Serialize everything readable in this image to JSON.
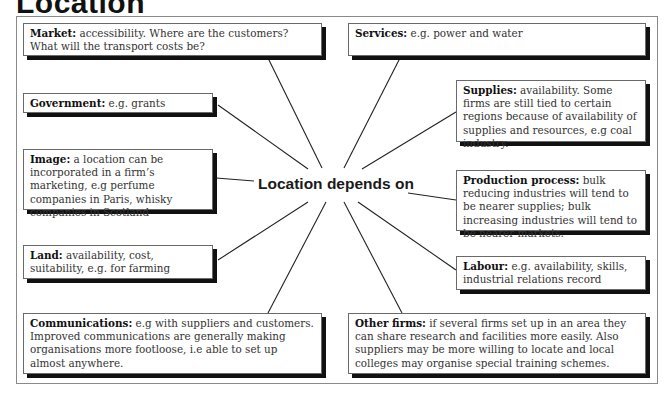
{
  "title": "Location",
  "center_label": "Location depends on",
  "colors": {
    "line": "#222222",
    "box_border": "#6a6a6a",
    "shadow": "#111111",
    "frame": "#8a8a8a"
  },
  "factors": {
    "market": {
      "label": "Market:",
      "text": " accessibility. Where are the customers? What will the transport costs be?"
    },
    "government": {
      "label": "Government:",
      "text": " e.g. grants"
    },
    "image": {
      "label": "Image:",
      "text": " a location can be incorporated in a firm’s marketing, e.g perfume companies in Paris, whisky companies in Scotland"
    },
    "land": {
      "label": "Land:",
      "text": " availability, cost, suitability, e.g. for farming"
    },
    "communications": {
      "label": "Communications:",
      "text": " e.g with suppliers and customers. Improved communications are generally making organisations more footloose, i.e able to set up almost anywhere."
    },
    "services": {
      "label": "Services:",
      "text": " e.g. power and water"
    },
    "supplies": {
      "label": "Supplies:",
      "text": " availability. Some firms are still tied to certain regions because of availability of supplies and resources, e.g coal industry."
    },
    "production": {
      "label": "Production process:",
      "text": " bulk reducing industries will tend to be nearer supplies; bulk increasing industries will tend to be nearer markets."
    },
    "labour": {
      "label": "Labour:",
      "text": " e.g. availability, skills, industrial relations record"
    },
    "other_firms": {
      "label": "Other firms:",
      "text": " if several firms set up in an area they can share research and facilities more easily. Also suppliers may be more willing to locate and local colleges may organise special training schemes."
    }
  }
}
